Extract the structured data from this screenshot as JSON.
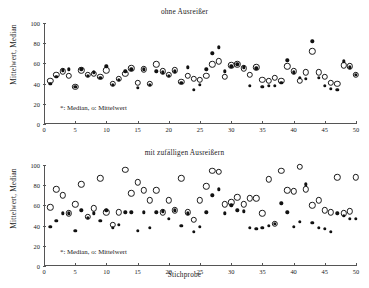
{
  "figure": {
    "ylabel": "Mittelwert, Median",
    "xlabel": "Stichprobe",
    "legend": "*: Median, o: Mittelwert",
    "yticks": [
      0,
      20,
      40,
      60,
      80,
      100
    ],
    "xticks": [
      0,
      5,
      10,
      15,
      20,
      25,
      30,
      35,
      40,
      45,
      50
    ]
  },
  "chart_data": [
    {
      "type": "scatter",
      "title": "ohne Ausreißer",
      "xlabel": "",
      "ylabel": "Mittelwert, Median",
      "xlim": [
        0,
        50
      ],
      "ylim": [
        0,
        100
      ],
      "grid": false,
      "legend_position": "inside-lower-left",
      "legend_text": "*: Median, o: Mittelwert",
      "x": [
        1,
        2,
        3,
        4,
        5,
        6,
        7,
        8,
        9,
        10,
        11,
        12,
        13,
        14,
        15,
        16,
        17,
        18,
        19,
        20,
        21,
        22,
        23,
        24,
        25,
        26,
        27,
        28,
        29,
        30,
        31,
        32,
        33,
        34,
        35,
        36,
        37,
        38,
        39,
        40,
        41,
        42,
        43,
        44,
        45,
        46,
        47,
        48,
        49,
        50
      ],
      "series": [
        {
          "name": "Mittelwert",
          "marker": "o",
          "values": [
            43,
            49,
            52,
            48,
            37,
            53,
            49,
            50,
            47,
            53,
            40,
            45,
            50,
            55,
            41,
            54,
            40,
            59,
            52,
            49,
            53,
            42,
            48,
            45,
            44,
            48,
            59,
            62,
            47,
            58,
            59,
            55,
            49,
            56,
            44,
            43,
            46,
            43,
            57,
            52,
            43,
            51,
            72,
            51,
            47,
            41,
            40,
            58,
            57,
            49
          ]
        },
        {
          "name": "Median",
          "marker": "*",
          "values": [
            40,
            47,
            53,
            54,
            37,
            54,
            48,
            51,
            46,
            57,
            39,
            44,
            52,
            54,
            36,
            54,
            39,
            52,
            51,
            48,
            52,
            41,
            56,
            34,
            39,
            54,
            70,
            76,
            52,
            57,
            59,
            56,
            38,
            55,
            37,
            38,
            38,
            41,
            63,
            51,
            46,
            45,
            82,
            46,
            38,
            35,
            34,
            62,
            56,
            49
          ]
        }
      ]
    },
    {
      "type": "scatter",
      "title": "mit zufälligen Ausreißern",
      "xlabel": "Stichprobe",
      "ylabel": "Mittelwert, Median",
      "xlim": [
        0,
        50
      ],
      "ylim": [
        0,
        100
      ],
      "grid": false,
      "legend_position": "inside-lower-left",
      "legend_text": "*: Median, o: Mittelwert",
      "x": [
        1,
        2,
        3,
        4,
        5,
        6,
        7,
        8,
        9,
        10,
        11,
        12,
        13,
        14,
        15,
        16,
        17,
        18,
        19,
        20,
        21,
        22,
        23,
        24,
        25,
        26,
        27,
        28,
        29,
        30,
        31,
        32,
        33,
        34,
        35,
        36,
        37,
        38,
        39,
        40,
        41,
        42,
        43,
        44,
        45,
        46,
        47,
        48,
        49,
        50
      ],
      "series": [
        {
          "name": "Mittelwert",
          "marker": "o",
          "values": [
            58,
            76,
            70,
            52,
            61,
            81,
            49,
            57,
            87,
            53,
            41,
            53,
            95,
            72,
            83,
            75,
            65,
            75,
            53,
            65,
            55,
            87,
            53,
            46,
            65,
            79,
            94,
            93,
            61,
            63,
            68,
            61,
            67,
            67,
            52,
            86,
            42,
            94,
            75,
            74,
            98,
            76,
            60,
            65,
            55,
            53,
            88,
            52,
            54,
            88
          ]
        },
        {
          "name": "Median",
          "marker": "*",
          "values": [
            39,
            45,
            52,
            52,
            35,
            55,
            48,
            52,
            45,
            55,
            38,
            41,
            53,
            53,
            35,
            53,
            38,
            53,
            54,
            47,
            55,
            40,
            52,
            34,
            39,
            53,
            70,
            76,
            52,
            60,
            55,
            54,
            38,
            37,
            38,
            40,
            42,
            62,
            53,
            39,
            44,
            81,
            43,
            38,
            37,
            34,
            52,
            50,
            47,
            47
          ]
        }
      ]
    }
  ]
}
